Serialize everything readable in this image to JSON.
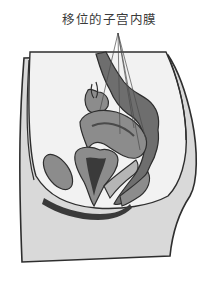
{
  "diagram": {
    "title": "移位的子宫内膜",
    "colors": {
      "background": "#ffffff",
      "body_fill": "#d9d9d9",
      "cavity_fill": "#f2f2f2",
      "organ_mid": "#8c8c8c",
      "organ_dark": "#4a4a4a",
      "organ_light": "#b5b5b5",
      "outline": "#2e2e2e",
      "text": "#3a3a3a"
    }
  }
}
